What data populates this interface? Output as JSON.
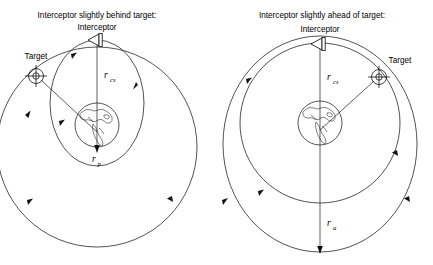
{
  "figure": {
    "type": "orbital-mechanics-diagram",
    "background_color": "#ffffff",
    "stroke_color": "#1a1a1a",
    "panel_count": 2
  },
  "panels": [
    {
      "id": "left",
      "title": "Interceptor slightly behind target:",
      "interceptor_label": "Interceptor",
      "target_label": "Target",
      "radius_labels": [
        {
          "symbol": "r",
          "subscript": "cs",
          "meaning": "co-orbital / circular station radius"
        },
        {
          "symbol": "r",
          "subscript": "p",
          "meaning": "perigee radius of transfer orbit"
        }
      ],
      "geometry": {
        "center": [
          97,
          147
        ],
        "target_orbit_radius": 100,
        "earth_center": [
          97,
          125
        ],
        "earth_radius": 22,
        "interceptor_position": [
          97,
          40
        ],
        "target_position": [
          35,
          75
        ],
        "transfer_orbit": {
          "rx": 47,
          "ry": 63,
          "cx": 97,
          "cy": 103
        },
        "r_cs_line": [
          [
            97,
            44
          ],
          [
            97,
            148
          ]
        ],
        "r_p_line": [
          [
            97,
            103
          ],
          [
            97,
            150
          ]
        ]
      },
      "r_cs_label_pos": [
        105,
        78
      ],
      "r_p_label_pos": [
        98,
        162
      ]
    },
    {
      "id": "right",
      "title": "Interceptor slightly ahead of target:",
      "interceptor_label": "Interceptor",
      "target_label": "Target",
      "radius_labels": [
        {
          "symbol": "r",
          "subscript": "cs",
          "meaning": "co-orbital / circular station radius"
        },
        {
          "symbol": "r",
          "subscript": "a",
          "meaning": "apogee radius of transfer orbit"
        }
      ],
      "geometry": {
        "center": [
          320,
          123
        ],
        "target_orbit_radius": 80,
        "earth_center": [
          320,
          123
        ],
        "earth_radius": 22,
        "interceptor_position": [
          320,
          44
        ],
        "target_position": [
          377,
          77
        ],
        "transfer_orbit": {
          "rx": 97,
          "ry": 108,
          "cx": 320,
          "cy": 144
        },
        "r_cs_line": [
          [
            320,
            46
          ],
          [
            320,
            125
          ]
        ],
        "r_a_line": [
          [
            320,
            123
          ],
          [
            320,
            252
          ]
        ]
      },
      "r_cs_label_pos": [
        327,
        80
      ],
      "r_a_label_pos": [
        327,
        226
      ]
    }
  ],
  "icons": {
    "interceptor": "spacecraft-triangle-icon",
    "target": "crosshair-circle-icon",
    "earth": "earth-globe-icon",
    "direction": "orbit-direction-arrow-icon"
  }
}
